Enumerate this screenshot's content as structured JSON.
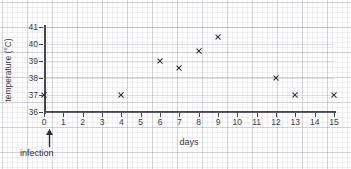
{
  "chart_data": {
    "type": "scatter",
    "title": "",
    "xlabel": "days",
    "ylabel": "temperature (°C)",
    "xlim": [
      0,
      15
    ],
    "ylim": [
      36,
      41
    ],
    "grid": true,
    "legend": "none",
    "marker": "x",
    "marker_color": "#2b2d31",
    "x_ticks": [
      "0",
      "1",
      "2",
      "3",
      "4",
      "5",
      "6",
      "7",
      "8",
      "9",
      "10",
      "11",
      "12",
      "13",
      "14",
      "15"
    ],
    "y_ticks": [
      "36",
      "37",
      "38",
      "39",
      "40",
      "41"
    ],
    "points": [
      {
        "x": 0,
        "y": 37.0
      },
      {
        "x": 4,
        "y": 37.0
      },
      {
        "x": 6,
        "y": 39.0
      },
      {
        "x": 7,
        "y": 38.6
      },
      {
        "x": 8,
        "y": 39.6
      },
      {
        "x": 9,
        "y": 40.4
      },
      {
        "x": 12,
        "y": 38.0
      },
      {
        "x": 13,
        "y": 37.0
      },
      {
        "x": 15,
        "y": 37.0
      }
    ],
    "annotations": [
      {
        "label": "infection",
        "x": 0,
        "marker": "up-arrow"
      }
    ]
  },
  "colors": {
    "axis": "#44464a",
    "text": "#3a3c40",
    "marker": "#2b2d31",
    "grid_major": "#9696a0",
    "grid_minor": "#b4b4be",
    "background": "#ffffff"
  }
}
